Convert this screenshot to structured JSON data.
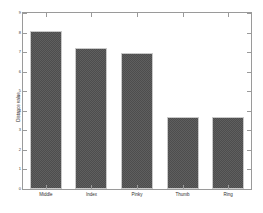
{
  "chart_data": {
    "type": "bar",
    "title": "",
    "xlabel": "",
    "ylabel": "Distance value",
    "categories": [
      "Middle",
      "Index",
      "Pinky",
      "Thumb",
      "Ring"
    ],
    "values": [
      8.1,
      7.2,
      6.95,
      3.7,
      3.7
    ],
    "ylim": [
      0,
      9
    ],
    "yticks": [
      0,
      1,
      2,
      3,
      4,
      5,
      6,
      7,
      8,
      9
    ],
    "ytick_labels": [
      "0",
      "1",
      "2",
      "3",
      "4",
      "5",
      "6",
      "7",
      "8",
      "9"
    ],
    "grid": false,
    "legend": null,
    "bar_color": "#4d4d4d",
    "bar_edge_color": "#c9c9c9",
    "axis_color": "#9a9a9a",
    "background_color": "#ffffff"
  }
}
